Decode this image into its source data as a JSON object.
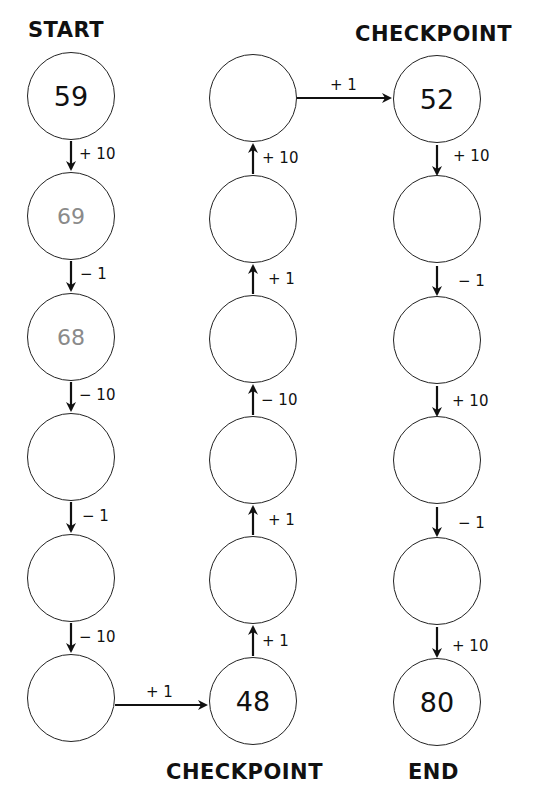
{
  "labels": {
    "start": "START",
    "checkpoint_top": "CHECKPOINT",
    "checkpoint_bottom": "CHECKPOINT",
    "end": "END"
  },
  "nodes": {
    "left": [
      {
        "value": "59",
        "style": "given"
      },
      {
        "value": "69",
        "style": "hint"
      },
      {
        "value": "68",
        "style": "hint"
      },
      {
        "value": "",
        "style": "blank"
      },
      {
        "value": "",
        "style": "blank"
      },
      {
        "value": "",
        "style": "blank"
      }
    ],
    "middle": [
      {
        "value": "",
        "style": "blank"
      },
      {
        "value": "",
        "style": "blank"
      },
      {
        "value": "",
        "style": "blank"
      },
      {
        "value": "",
        "style": "blank"
      },
      {
        "value": "",
        "style": "blank"
      },
      {
        "value": "48",
        "style": "given"
      }
    ],
    "right": [
      {
        "value": "52",
        "style": "given"
      },
      {
        "value": "",
        "style": "blank"
      },
      {
        "value": "",
        "style": "blank"
      },
      {
        "value": "",
        "style": "blank"
      },
      {
        "value": "",
        "style": "blank"
      },
      {
        "value": "80",
        "style": "given"
      }
    ]
  },
  "operations": {
    "left_down": [
      "+ 10",
      "− 1",
      "− 10",
      "− 1",
      "− 10"
    ],
    "bottom_left_to_middle": "+ 1",
    "middle_up": [
      "+ 1",
      "+ 1",
      "− 10",
      "+ 1",
      "+ 10"
    ],
    "top_middle_to_right": "+ 1",
    "right_down": [
      "+ 10",
      "− 1",
      "+ 10",
      "− 1",
      "+ 10"
    ]
  },
  "colors": {
    "stroke": "#222222",
    "given_text": "#111111",
    "hint_text": "#8a8a8a",
    "background": "#ffffff"
  }
}
